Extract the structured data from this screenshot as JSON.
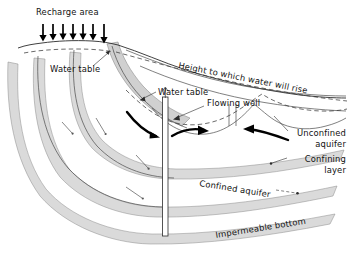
{
  "figure": {
    "background_color": "#ffffff",
    "width": 349,
    "height": 262
  },
  "colors": {
    "band_fill": "#dadada",
    "band_stroke": "#8a8a8a",
    "ink": "#111111",
    "outline": "#4a4a4a",
    "arrow": "#000000"
  },
  "labels": {
    "recharge_area": "Recharge area",
    "water_table_left": "Water table",
    "water_table_right": "Water table",
    "height_to_which_water_will_rise": "Height to which water will rise",
    "flowing_well": "Flowing well",
    "unconfined_aquifer_line1": "Unconfined",
    "unconfined_aquifer_line2": "aquifer",
    "confining_layer_line1": "Confining",
    "confining_layer_line2": "layer",
    "confined_aquifer": "Confined aquifer",
    "impermeable_bottom": "Impermeable bottom"
  },
  "recharge": {
    "arrow_count": 7,
    "direction": "down",
    "x_positions": [
      43,
      53,
      63,
      73,
      83,
      93,
      103
    ],
    "top_y": 24,
    "bottom_y": 42
  },
  "flow_arrows": {
    "thick_count": 3,
    "thin_count": 4,
    "description": "groundwater flow converging toward the flowing well"
  },
  "well": {
    "name": "Flowing well",
    "x": 165,
    "top_y": 95,
    "bottom_y": 235,
    "flowing": true
  }
}
